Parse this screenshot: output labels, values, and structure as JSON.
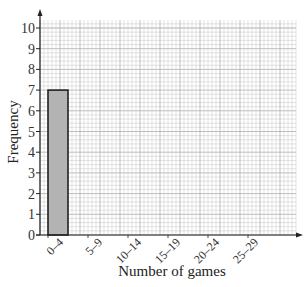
{
  "chart_data": {
    "type": "bar",
    "title": "",
    "xlabel": "Number of games",
    "ylabel": "Frequency",
    "categories": [
      "0–4",
      "5–9",
      "10–14",
      "15–19",
      "20–24",
      "25–29"
    ],
    "values": [
      7,
      null,
      null,
      null,
      null,
      null
    ],
    "ylim": [
      0,
      10
    ],
    "yticks": [
      "0",
      "1",
      "2",
      "3",
      "4",
      "5",
      "6",
      "7",
      "8",
      "9",
      "10"
    ],
    "grid": true,
    "bar_color": "#b3b3b3",
    "bar_edge": "#222222",
    "grid_color": "#b8b8b8"
  }
}
